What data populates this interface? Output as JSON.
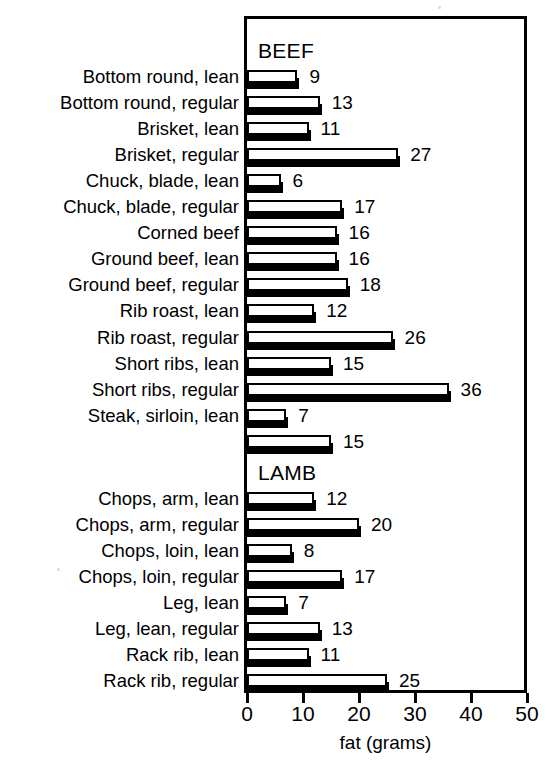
{
  "chart_data": {
    "type": "bar",
    "orientation": "horizontal",
    "title": "",
    "xlabel": "fat (grams)",
    "ylabel": "",
    "xlim": [
      0,
      50
    ],
    "xticks": [
      0,
      10,
      20,
      30,
      40,
      50
    ],
    "xtick_labels": [
      "0",
      "10",
      "20",
      "30",
      "40",
      "50"
    ],
    "grid": false,
    "legend": false,
    "units": "grams",
    "sections": [
      {
        "name": "BEEF",
        "categories": [
          "Bottom round, lean",
          "Bottom round, regular",
          "Brisket, lean",
          "Brisket, regular",
          "Chuck, blade, lean",
          "Chuck, blade, regular",
          "Corned beef",
          "Ground beef, lean",
          "Ground beef, regular",
          "Rib roast, lean",
          "Rib roast, regular",
          "Short ribs, lean",
          "Short ribs, regular",
          "Steak, sirloin, lean",
          ""
        ],
        "values": [
          9,
          13,
          11,
          27,
          6,
          17,
          16,
          16,
          18,
          12,
          26,
          15,
          36,
          7,
          15
        ]
      },
      {
        "name": "LAMB",
        "categories": [
          "Chops, arm, lean",
          "Chops, arm, regular",
          "Chops, loin, lean",
          "Chops, loin, regular",
          "Leg, lean",
          "Leg, lean, regular",
          "Rack rib, lean",
          "Rack rib, regular"
        ],
        "values": [
          12,
          20,
          8,
          17,
          7,
          13,
          11,
          25
        ]
      }
    ],
    "categories": [
      "Bottom round, lean",
      "Bottom round, regular",
      "Brisket, lean",
      "Brisket, regular",
      "Chuck, blade, lean",
      "Chuck, blade, regular",
      "Corned beef",
      "Ground beef, lean",
      "Ground beef, regular",
      "Rib roast, lean",
      "Rib roast, regular",
      "Short ribs, lean",
      "Short ribs, regular",
      "Steak, sirloin, lean",
      "",
      "Chops, arm, lean",
      "Chops, arm, regular",
      "Chops, loin, lean",
      "Chops, loin, regular",
      "Leg, lean",
      "Leg, lean, regular",
      "Rack rib, lean",
      "Rack rib, regular"
    ],
    "values": [
      9,
      13,
      11,
      27,
      6,
      17,
      16,
      16,
      18,
      12,
      26,
      15,
      36,
      7,
      15,
      12,
      20,
      8,
      17,
      7,
      13,
      11,
      25
    ],
    "colors": {
      "bar_face": "#ffffff",
      "bar_outline": "#000000",
      "bar_shadow": "#000000",
      "axis": "#000000",
      "text": "#000000",
      "background": "#ffffff"
    }
  },
  "axis": {
    "title": "fat (grams)",
    "ticks": [
      "0",
      "10",
      "20",
      "30",
      "40",
      "50"
    ]
  },
  "headings": {
    "beef": "BEEF",
    "lamb": "LAMB"
  },
  "rows": [
    {
      "label": "Bottom round, lean",
      "value": "9",
      "n": 9
    },
    {
      "label": "Bottom round, regular",
      "value": "13",
      "n": 13
    },
    {
      "label": "Brisket, lean",
      "value": "11",
      "n": 11
    },
    {
      "label": "Brisket, regular",
      "value": "27",
      "n": 27
    },
    {
      "label": "Chuck, blade, lean",
      "value": "6",
      "n": 6
    },
    {
      "label": "Chuck, blade, regular",
      "value": "17",
      "n": 17
    },
    {
      "label": "Corned beef",
      "value": "16",
      "n": 16
    },
    {
      "label": "Ground beef, lean",
      "value": "16",
      "n": 16
    },
    {
      "label": "Ground beef, regular",
      "value": "18",
      "n": 18
    },
    {
      "label": "Rib roast, lean",
      "value": "12",
      "n": 12
    },
    {
      "label": "Rib roast, regular",
      "value": "26",
      "n": 26
    },
    {
      "label": "Short ribs, lean",
      "value": "15",
      "n": 15
    },
    {
      "label": "Short ribs, regular",
      "value": "36",
      "n": 36
    },
    {
      "label": "Steak, sirloin, lean",
      "value": "7",
      "n": 7
    },
    {
      "label": "",
      "value": "15",
      "n": 15
    },
    {
      "label": "Chops, arm, lean",
      "value": "12",
      "n": 12
    },
    {
      "label": "Chops, arm, regular",
      "value": "20",
      "n": 20
    },
    {
      "label": "Chops, loin, lean",
      "value": "8",
      "n": 8
    },
    {
      "label": "Chops, loin, regular",
      "value": "17",
      "n": 17
    },
    {
      "label": "Leg, lean",
      "value": "7",
      "n": 7
    },
    {
      "label": "Leg, lean, regular",
      "value": "13",
      "n": 13
    },
    {
      "label": "Rack rib, lean",
      "value": "11",
      "n": 11
    },
    {
      "label": "Rack rib, regular",
      "value": "25",
      "n": 25
    }
  ]
}
